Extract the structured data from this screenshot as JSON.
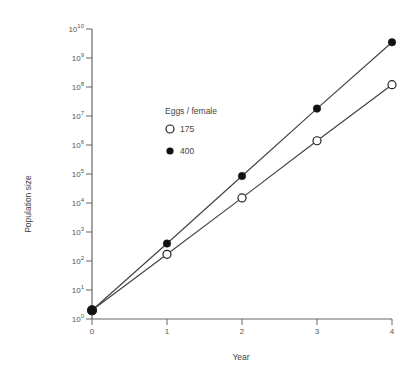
{
  "chart_data": {
    "type": "line",
    "title": "",
    "xlabel": "Year",
    "ylabel": "Population size",
    "yscale": "log",
    "ylim": [
      1,
      10000000000
    ],
    "xlim": [
      0,
      4
    ],
    "grid": false,
    "x": [
      0,
      1,
      2,
      3,
      4
    ],
    "x_ticks": [
      "0",
      "1",
      "2",
      "3",
      "4"
    ],
    "y_ticks": [
      {
        "base": "10",
        "exp": "0"
      },
      {
        "base": "10",
        "exp": "1"
      },
      {
        "base": "10",
        "exp": "2"
      },
      {
        "base": "10",
        "exp": "3"
      },
      {
        "base": "10",
        "exp": "4"
      },
      {
        "base": "10",
        "exp": "5"
      },
      {
        "base": "10",
        "exp": "6"
      },
      {
        "base": "10",
        "exp": "7"
      },
      {
        "base": "10",
        "exp": "8"
      },
      {
        "base": "10",
        "exp": "9"
      },
      {
        "base": "10",
        "exp": "10"
      }
    ],
    "legend": {
      "title": "Eggs / female",
      "position": "upper-left-inside"
    },
    "series": [
      {
        "name": "175",
        "marker": "open-circle",
        "values": [
          2,
          170,
          15000,
          1400000,
          120000000
        ]
      },
      {
        "name": "400",
        "marker": "filled-circle",
        "values": [
          2,
          400,
          85000,
          18000000,
          3500000000
        ]
      }
    ]
  },
  "colors": {
    "line": "#444444",
    "axis": "#666666",
    "marker_fill_open": "#ffffff",
    "marker_fill_closed": "#111111"
  }
}
